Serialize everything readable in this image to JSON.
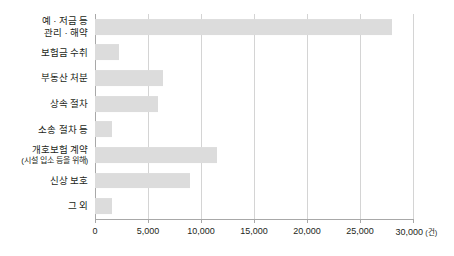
{
  "chart_data": {
    "type": "bar",
    "orientation": "horizontal",
    "title": "",
    "subtitle": "",
    "xlabel": "",
    "ylabel": "",
    "unit_label": "(건)",
    "xlim": [
      0,
      30000
    ],
    "xticks": [
      0,
      5000,
      10000,
      15000,
      20000,
      25000,
      30000
    ],
    "xticklabels": [
      "0",
      "5,000",
      "10,000",
      "15,000",
      "20,000",
      "25,000",
      "30,000"
    ],
    "grid": true,
    "grid_axis": "x",
    "legend": false,
    "categories": [
      "예 · 저금 등\n관리 · 해약",
      "보험금 수취",
      "부동산 처분",
      "상속 절차",
      "소송 절차 등",
      "개호보험 계약",
      "신상 보호",
      "그 외"
    ],
    "category_sublabels": [
      "",
      "",
      "",
      "",
      "",
      "(시설 입소 등을 위해)",
      "",
      ""
    ],
    "values": [
      28000,
      2300,
      6400,
      5900,
      1600,
      11500,
      9000,
      1600
    ],
    "bar_color": "#dcdcdc",
    "axis_color": "#a8a8a8",
    "grid_color": "#d4d4d4",
    "text_color": "#231f20",
    "background": "#ffffff"
  },
  "axis": {
    "unit_suffix": "(건)"
  }
}
